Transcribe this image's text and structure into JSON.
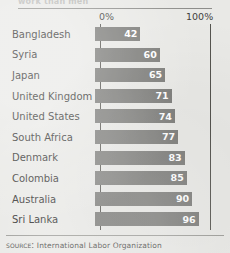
{
  "clipped_headline": "work than men",
  "source": {
    "prefix": "Source:",
    "text": "International Labor Organization"
  },
  "chart_data": {
    "type": "bar",
    "orientation": "horizontal",
    "title": "",
    "xlabel": "",
    "ylabel": "",
    "xlim": [
      0,
      100
    ],
    "grid": false,
    "legend": null,
    "tick_labels": [
      "0%",
      "100%"
    ],
    "categories": [
      "Bangladesh",
      "Syria",
      "Japan",
      "United Kingdom",
      "United States",
      "South Africa",
      "Denmark",
      "Colombia",
      "Australia",
      "Sri Lanka"
    ],
    "values": [
      42,
      60,
      65,
      71,
      74,
      77,
      83,
      85,
      90,
      96
    ],
    "bar_color": "#7b7b78",
    "value_label_color": "#ffffff",
    "background_color": "#e9e9e6"
  }
}
